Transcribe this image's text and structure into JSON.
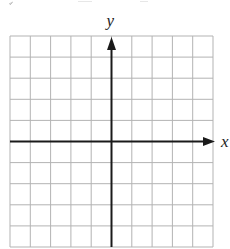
{
  "diagram": {
    "type": "coordinate-grid",
    "grid": {
      "columns": 10,
      "rows": 10,
      "left": 10,
      "top": 36,
      "right": 213,
      "bottom": 247,
      "line_color": "#b3b3b3",
      "axis_color": "#1a1a1a",
      "background": "#ffffff"
    },
    "axes": {
      "x": {
        "label": "x",
        "arrow": "positive"
      },
      "y": {
        "label": "y",
        "arrow": "positive"
      },
      "origin_column_index": 5,
      "origin_row_index": 5
    },
    "top_text_fragment": "cropped"
  }
}
